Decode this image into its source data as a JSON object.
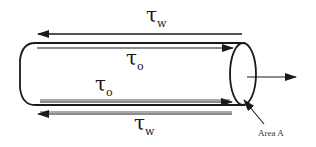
{
  "diagram": {
    "type": "free-body-cylinder",
    "labels": {
      "tau_w_top": {
        "symbol": "τ",
        "subscript": "w"
      },
      "tau_o_top": {
        "symbol": "τ",
        "subscript": "o"
      },
      "tau_o_bottom": {
        "symbol": "τ",
        "subscript": "o"
      },
      "tau_w_bottom": {
        "symbol": "τ",
        "subscript": "w"
      },
      "area": "Area A"
    },
    "arrows": [
      {
        "id": "outer-top",
        "label": "τw",
        "direction": "left"
      },
      {
        "id": "inner-top",
        "label": "τo",
        "direction": "right"
      },
      {
        "id": "inner-bottom",
        "label": "τo",
        "direction": "right"
      },
      {
        "id": "outer-bottom",
        "label": "τw",
        "direction": "left"
      },
      {
        "id": "axial-force",
        "direction": "right"
      },
      {
        "id": "area-pointer",
        "target": "Area A"
      }
    ],
    "colors": {
      "stroke": "#1a1a1a",
      "light_stroke": "#555555",
      "background": "#ffffff"
    }
  }
}
